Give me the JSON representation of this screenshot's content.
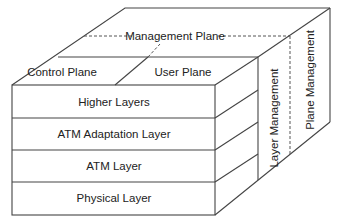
{
  "diagram": {
    "management_plane": "Management Plane",
    "control_plane": "Control Plane",
    "user_plane": "User Plane",
    "layers": [
      "Higher Layers",
      "ATM Adaptation Layer",
      "ATM Layer",
      "Physical Layer"
    ],
    "layer_management": "Layer Management",
    "plane_management": "Plane Management",
    "colors": {
      "line": "#444444",
      "text": "#222222",
      "background": "#ffffff"
    }
  }
}
